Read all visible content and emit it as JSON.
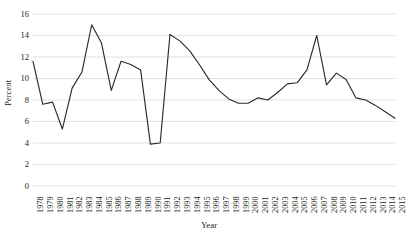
{
  "chart_data": {
    "type": "line",
    "title": "",
    "xlabel": "Year",
    "ylabel": "Percent",
    "grid": true,
    "grid_axis": "y",
    "legend": false,
    "legend_position": "none",
    "line_color": "#2b2b2b",
    "grid_color": "#d9d9d9",
    "background_color": "#ffffff",
    "text_color": "#231f20",
    "xlim": [
      1978,
      2015
    ],
    "ylim": [
      0,
      16
    ],
    "ytick_step": 2,
    "ytick_labels": [
      "0",
      "2",
      "4",
      "6",
      "8",
      "10",
      "12",
      "14",
      "16"
    ],
    "ytick_values": [
      0,
      2,
      4,
      6,
      8,
      10,
      12,
      14,
      16
    ],
    "categories": [
      "1978",
      "1979",
      "1980",
      "1981",
      "1982",
      "1983",
      "1984",
      "1985",
      "1986",
      "1987",
      "1988",
      "1989",
      "1990",
      "1991",
      "1992",
      "1993",
      "1994",
      "1995",
      "1996",
      "1997",
      "1998",
      "1999",
      "2000",
      "2001",
      "2002",
      "2003",
      "2004",
      "2005",
      "2006",
      "2007",
      "2008",
      "2009",
      "2010",
      "2011",
      "2012",
      "2013",
      "2014",
      "2015"
    ],
    "values": [
      11.6,
      7.6,
      7.8,
      5.3,
      9.1,
      10.6,
      15.0,
      13.3,
      8.9,
      11.6,
      11.3,
      10.8,
      3.9,
      4.0,
      14.1,
      13.5,
      12.6,
      11.3,
      9.9,
      8.9,
      8.1,
      7.7,
      7.7,
      8.2,
      8.0,
      8.7,
      9.5,
      9.6,
      10.8,
      14.0,
      9.4,
      10.5,
      9.9,
      8.2,
      8.0,
      7.5,
      6.9,
      6.3
    ],
    "x": [
      1978,
      1979,
      1980,
      1981,
      1982,
      1983,
      1984,
      1985,
      1986,
      1987,
      1988,
      1989,
      1990,
      1991,
      1992,
      1993,
      1994,
      1995,
      1996,
      1997,
      1998,
      1999,
      2000,
      2001,
      2002,
      2003,
      2004,
      2005,
      2006,
      2007,
      2008,
      2009,
      2010,
      2011,
      2012,
      2013,
      2014,
      2015
    ]
  }
}
